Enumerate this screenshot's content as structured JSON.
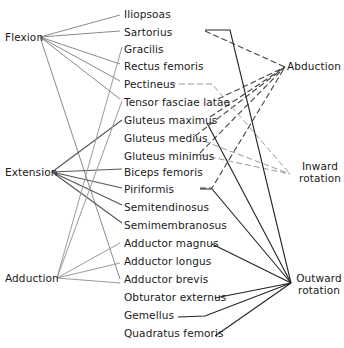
{
  "left_actions": [
    {
      "key": "flexion",
      "label": "Flexion"
    },
    {
      "key": "extension",
      "label": "Extension"
    },
    {
      "key": "adduction",
      "label": "Adduction"
    }
  ],
  "muscles": [
    "Iliopsoas",
    "Sartorius",
    "Gracilis",
    "Rectus femoris",
    "Pectineus",
    "Tensor fasciae latae",
    "Gluteus maximus",
    "Gluteus medius",
    "Gluteus minimus",
    "Biceps femoris",
    "Piriformis",
    "Semitendinosus",
    "Semimembranosus",
    "Adductor magnus",
    "Adductor longus",
    "Adductor brevis",
    "Obturator externus",
    "Gemellus",
    "Quadratus femoris"
  ],
  "right_actions": [
    {
      "key": "abduction",
      "line1": "Abduction",
      "line2": ""
    },
    {
      "key": "inward_rotation",
      "line1": "Inward",
      "line2": "rotation"
    },
    {
      "key": "outward_rotation",
      "line1": "Outward",
      "line2": "rotation"
    }
  ],
  "caption": "Fig. 1-17. Actions of hip muscles",
  "connections": {
    "flexion": [
      "Iliopsoas",
      "Sartorius",
      "Rectus femoris",
      "Pectineus",
      "Tensor fasciae latae",
      "Adductor longus"
    ],
    "extension": [
      "Gluteus maximus",
      "Biceps femoris",
      "Piriformis",
      "Semitendinosus",
      "Semimembranosus"
    ],
    "adduction": [
      "Gracilis",
      "Pectineus",
      "Adductor magnus",
      "Adductor longus",
      "Adductor brevis"
    ],
    "abduction": [
      "Sartorius",
      "Tensor fasciae latae",
      "Gluteus maximus",
      "Gluteus medius",
      "Gluteus minimus",
      "Piriformis"
    ],
    "inward_rotation": [
      "Pectineus",
      "Gluteus medius",
      "Gluteus minimus"
    ],
    "outward_rotation": [
      "Sartorius",
      "Gluteus maximus",
      "Piriformis",
      "Adductor magnus",
      "Obturator externus",
      "Gemellus",
      "Quadratus femoris"
    ]
  },
  "colors": {
    "left_lines": "#8a8a8a",
    "extension_lines": "#555555",
    "right_solid": "#222222",
    "right_dashed": "#444444",
    "inward_dashed": "#9a9a9a"
  }
}
